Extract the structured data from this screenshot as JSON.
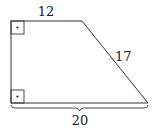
{
  "diagram": {
    "type": "right-trapezoid",
    "labels": {
      "top": "12",
      "slant": "17",
      "bottom": "20"
    },
    "right_angle_markers": [
      "top-left",
      "bottom-left"
    ],
    "colors": {
      "stroke": "#333333",
      "background": "#ffffff"
    }
  }
}
